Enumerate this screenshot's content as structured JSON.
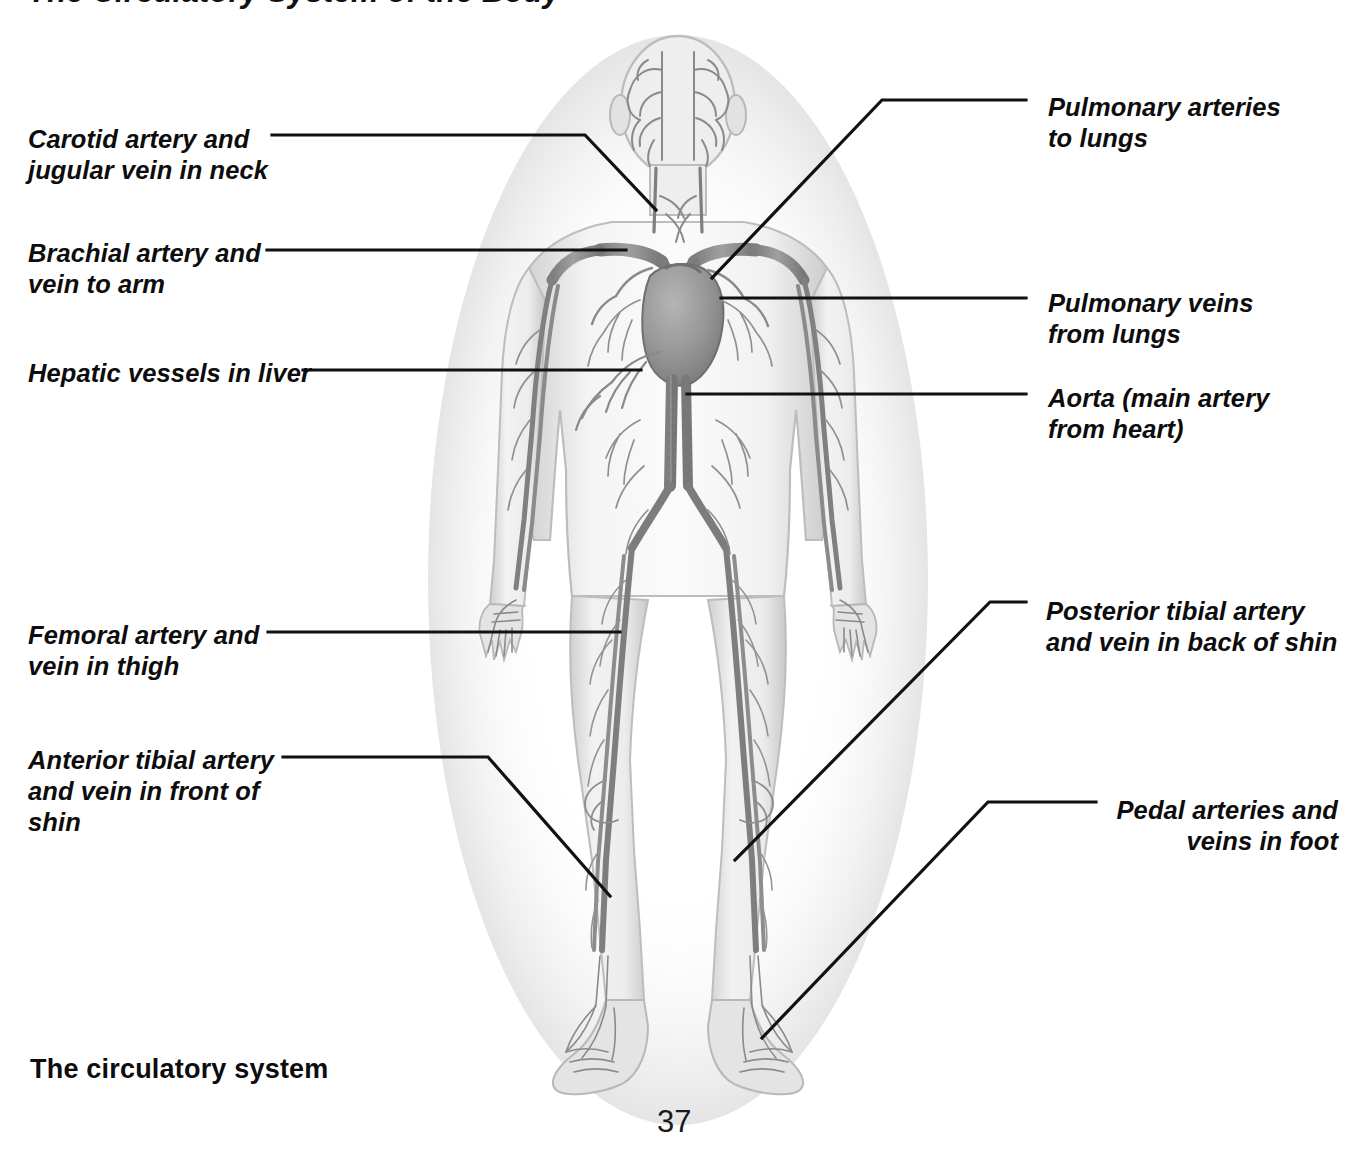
{
  "page": {
    "title": "The Circulatory System of the Body",
    "caption": "The circulatory system",
    "folio": "37",
    "ink_color": "#0d0d0d",
    "leader_color": "#111111",
    "background": "#ffffff"
  },
  "figure": {
    "name": "human-circulatory-system-illustration",
    "palette": {
      "body_fill": "#e9e9e9",
      "body_edge": "#b9b9b9",
      "vessel": "#8d8d8d",
      "vessel_dark": "#6e6e6e",
      "heart": "#9a9a9a"
    }
  },
  "labels": {
    "left": [
      {
        "id": "carotid-jugular",
        "text": "Carotid artery and\njugular vein in neck",
        "x": 28,
        "y": 124,
        "leader": "M 272 135 L 585 135 L 656 210"
      },
      {
        "id": "brachial",
        "text": "Brachial artery and\nvein to arm",
        "x": 28,
        "y": 238,
        "leader": "M 267 250 L 626 250"
      },
      {
        "id": "hepatic",
        "text": "Hepatic vessels in liver",
        "x": 28,
        "y": 358,
        "leader": "M 303 370 L 641 370"
      },
      {
        "id": "femoral",
        "text": "Femoral artery and\nvein in thigh",
        "x": 28,
        "y": 620,
        "leader": "M 268 632 L 620 632"
      },
      {
        "id": "anterior-tibial",
        "text": "Anterior tibial artery\nand vein in front of\nshin",
        "x": 28,
        "y": 745,
        "leader": "M 283 757 L 488 757 L 610 896"
      }
    ],
    "right": [
      {
        "id": "pulmonary-arteries",
        "text": "Pulmonary arteries\nto lungs",
        "x": 1048,
        "y": 92,
        "align": "left",
        "leader": "M 1026 100 L 882 100 L 712 278"
      },
      {
        "id": "pulmonary-veins",
        "text": "Pulmonary veins\nfrom lungs",
        "x": 1048,
        "y": 288,
        "align": "left",
        "leader": "M 1026 298 L 721 298"
      },
      {
        "id": "aorta",
        "text": "Aorta (main artery\nfrom heart)",
        "x": 1048,
        "y": 383,
        "align": "left",
        "leader": "M 1026 394 L 687 394"
      },
      {
        "id": "posterior-tibial",
        "text": "Posterior tibial artery\nand vein in back of shin",
        "x": 1046,
        "y": 596,
        "align": "left",
        "leader": "M 1026 602 L 990 602 L 735 860"
      },
      {
        "id": "pedal",
        "text": "Pedal arteries and\nveins in foot",
        "x": 1008,
        "y": 795,
        "align": "right",
        "leader": "M 1096 802 L 988 802 L 762 1038"
      }
    ]
  }
}
